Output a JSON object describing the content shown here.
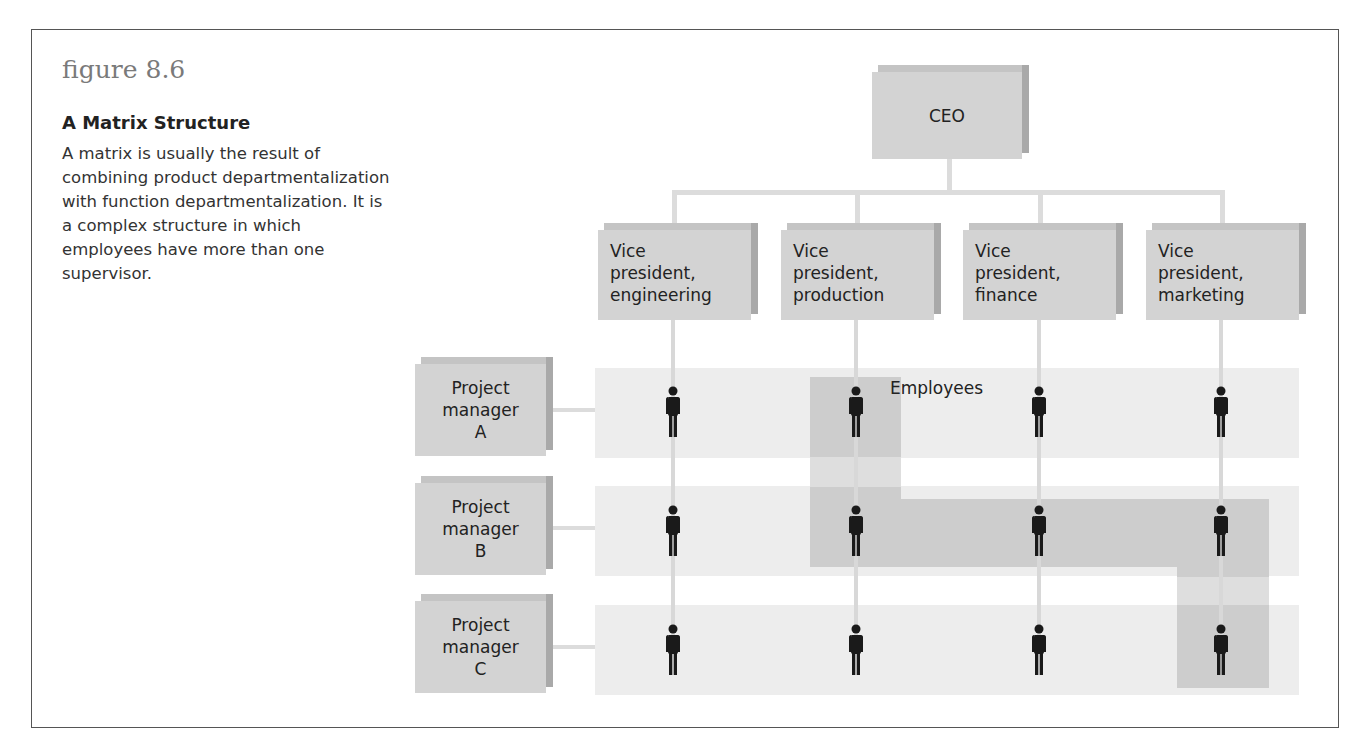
{
  "figure": {
    "number": "figure 8.6",
    "title": "A Matrix Structure",
    "caption": "A matrix is usually the result of combining product departmentalization with function departmentalization. It is a complex structure in which employees have more than one supervisor."
  },
  "chart": {
    "ceo": "CEO",
    "vice_presidents": [
      {
        "line1": "Vice",
        "line2": "president,",
        "line3": "engineering"
      },
      {
        "line1": "Vice",
        "line2": "president,",
        "line3": "production"
      },
      {
        "line1": "Vice",
        "line2": "president,",
        "line3": "finance"
      },
      {
        "line1": "Vice",
        "line2": "president,",
        "line3": "marketing"
      }
    ],
    "project_managers": [
      {
        "line1": "Project",
        "line2": "manager",
        "line3": "A"
      },
      {
        "line1": "Project",
        "line2": "manager",
        "line3": "B"
      },
      {
        "line1": "Project",
        "line2": "manager",
        "line3": "C"
      }
    ],
    "employees_label": "Employees",
    "employee_grid": {
      "rows": 3,
      "columns": 4,
      "icon": "person-icon"
    },
    "highlighted_employees": [
      [
        0,
        1
      ],
      [
        1,
        1
      ],
      [
        1,
        2
      ],
      [
        1,
        3
      ],
      [
        2,
        3
      ]
    ]
  }
}
